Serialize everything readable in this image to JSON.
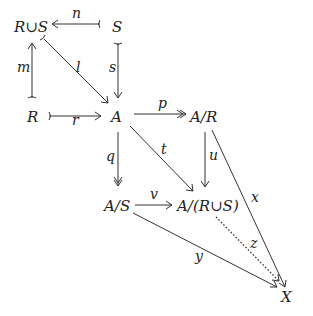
{
  "diagram": {
    "nodes": {
      "RuS": "R∪S",
      "S": "S",
      "R": "R",
      "A": "A",
      "AR": "A/R",
      "AS": "A/S",
      "ARuS": "A/(R∪S)",
      "X": "X"
    },
    "arrows": {
      "n": "n",
      "m": "m",
      "l": "l",
      "s": "s",
      "r": "r",
      "p": "p",
      "q": "q",
      "t": "t",
      "u": "u",
      "v": "v",
      "x": "x",
      "y": "y",
      "z": "z"
    }
  }
}
